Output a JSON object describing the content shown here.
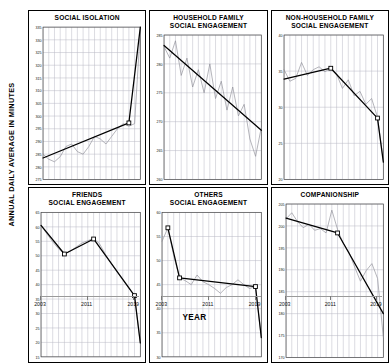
{
  "chart_data": {
    "type": "line",
    "title": "",
    "xlabel": "YEAR",
    "ylabel": "ANNUAL DAILY AVERAGE IN MINUTES",
    "grid": true,
    "legend": false,
    "xticks": [
      "2003",
      "2011",
      "2019"
    ],
    "panels": [
      {
        "id": "social-isolation",
        "title": "SOCIAL ISOLATION",
        "ylim": [
          275,
          335
        ],
        "yticks": [
          335,
          330,
          325,
          320,
          315,
          310,
          305,
          300,
          295,
          290,
          285,
          280,
          275
        ],
        "x": [
          2003,
          2004,
          2005,
          2006,
          2007,
          2008,
          2009,
          2010,
          2011,
          2012,
          2013,
          2014,
          2015,
          2016,
          2017,
          2018,
          2019,
          2020
        ],
        "series": [
          {
            "name": "observed",
            "style": "thin-gray",
            "values": [
              285,
              283,
              282,
              284,
              288,
              289,
              286,
              285,
              288,
              292,
              291,
              289,
              292,
              295,
              297,
              296,
              297,
              334
            ]
          },
          {
            "name": "trend",
            "style": "thick-black",
            "breakpoints": [
              [
                2003,
                283.5
              ],
              [
                2018,
                297.3
              ],
              [
                2020,
                335.0
              ]
            ],
            "markers": [
              [
                2018,
                297.3
              ]
            ]
          }
        ]
      },
      {
        "id": "household-family-social-engagement",
        "title": "HOUSEHOLD FAMILY\nSOCIAL ENGAGEMENT",
        "ylim": [
          260,
          285
        ],
        "yticks": [
          285,
          280,
          275,
          270,
          265,
          260
        ],
        "x": [
          2003,
          2004,
          2005,
          2006,
          2007,
          2008,
          2009,
          2010,
          2011,
          2012,
          2013,
          2014,
          2015,
          2016,
          2017,
          2018,
          2019,
          2020
        ],
        "series": [
          {
            "name": "observed",
            "style": "thin-gray",
            "values": [
              283,
              281,
              284,
              278,
              281,
              276,
              279,
              275,
              280,
              274,
              277,
              272,
              276,
              271,
              273,
              267,
              264,
              269
            ]
          },
          {
            "name": "trend",
            "style": "thick-black",
            "breakpoints": [
              [
                2003,
                283.2
              ],
              [
                2020,
                268.5
              ]
            ],
            "markers": []
          }
        ]
      },
      {
        "id": "non-household-family-social-engagement",
        "title": "NON-HOUSEHOLD FAMILY\nSOCIAL ENGAGEMENT",
        "ylim": [
          20,
          40
        ],
        "yticks": [
          40,
          35,
          30,
          25,
          20
        ],
        "x": [
          2003,
          2004,
          2005,
          2006,
          2007,
          2008,
          2009,
          2010,
          2011,
          2012,
          2013,
          2014,
          2015,
          2016,
          2017,
          2018,
          2019,
          2020
        ],
        "series": [
          {
            "name": "observed",
            "style": "thin-gray",
            "values": [
              35.2,
              33.6,
              34.0,
              36.2,
              34.4,
              35.2,
              35.6,
              34.9,
              35.4,
              34.6,
              32.6,
              33.8,
              31.6,
              32.2,
              30.4,
              31.2,
              28.6,
              22.6
            ]
          },
          {
            "name": "trend",
            "style": "thick-black",
            "breakpoints": [
              [
                2003,
                33.9
              ],
              [
                2011,
                35.4
              ],
              [
                2019,
                28.5
              ],
              [
                2020,
                22.4
              ]
            ],
            "markers": [
              [
                2011,
                35.4
              ],
              [
                2019,
                28.5
              ]
            ]
          }
        ]
      },
      {
        "id": "friends-social-engagement",
        "title": "FRIENDS\nSOCIAL ENGAGEMENT",
        "ylim": [
          15,
          65
        ],
        "yticks": [
          65,
          60,
          55,
          50,
          45,
          40,
          35,
          30,
          25,
          20,
          15
        ],
        "x": [
          2003,
          2004,
          2005,
          2006,
          2007,
          2008,
          2009,
          2010,
          2011,
          2012,
          2013,
          2014,
          2015,
          2016,
          2017,
          2018,
          2019,
          2020
        ],
        "series": [
          {
            "name": "observed",
            "style": "thin-gray",
            "values": [
              60.5,
              57.6,
              54.8,
              52.4,
              50.6,
              51.6,
              53.0,
              54.4,
              55.2,
              56.0,
              54.2,
              50.6,
              47.4,
              44.4,
              41.6,
              38.8,
              36.2,
              19.8
            ]
          },
          {
            "name": "trend",
            "style": "thick-black",
            "breakpoints": [
              [
                2003,
                60.5
              ],
              [
                2007,
                50.6
              ],
              [
                2012,
                55.8
              ],
              [
                2019,
                36.2
              ],
              [
                2020,
                19.8
              ]
            ],
            "markers": [
              [
                2007,
                50.6
              ],
              [
                2012,
                55.8
              ],
              [
                2019,
                36.2
              ]
            ]
          }
        ]
      },
      {
        "id": "others-social-engagement",
        "title": "OTHERS\nSOCIAL ENGAGEMENT",
        "ylim": [
          30,
          60
        ],
        "yticks": [
          60,
          55,
          50,
          45,
          40,
          35,
          30
        ],
        "x": [
          2003,
          2004,
          2005,
          2006,
          2007,
          2008,
          2009,
          2010,
          2011,
          2012,
          2013,
          2014,
          2015,
          2016,
          2017,
          2018,
          2019,
          2020
        ],
        "series": [
          {
            "name": "observed",
            "style": "thin-gray",
            "values": [
              54.0,
              56.8,
              51.0,
              46.4,
              45.8,
              45.0,
              47.0,
              45.6,
              45.0,
              44.2,
              43.2,
              44.4,
              45.0,
              46.0,
              45.0,
              44.2,
              44.6,
              34.0
            ]
          },
          {
            "name": "trend",
            "style": "thick-black",
            "breakpoints": [
              [
                2004,
                56.8
              ],
              [
                2006,
                46.4
              ],
              [
                2019,
                44.6
              ],
              [
                2020,
                34.0
              ]
            ],
            "markers": [
              [
                2004,
                56.8
              ],
              [
                2006,
                46.4
              ],
              [
                2019,
                44.6
              ]
            ]
          }
        ]
      },
      {
        "id": "companionship",
        "title": "COMPANIONSHIP",
        "ylim": [
          170,
          205
        ],
        "yticks": [
          205,
          200,
          195,
          190,
          185,
          180,
          175,
          170
        ],
        "x": [
          2003,
          2004,
          2005,
          2006,
          2007,
          2008,
          2009,
          2010,
          2011,
          2012,
          2013,
          2014,
          2015,
          2016,
          2017,
          2018,
          2019,
          2020
        ],
        "series": [
          {
            "name": "observed",
            "style": "thin-gray",
            "values": [
              201.6,
              203.0,
              201.0,
              199.6,
              200.4,
              199.0,
              199.4,
              198.4,
              203.6,
              199.2,
              196.0,
              194.0,
              190.6,
              187.4,
              189.8,
              191.4,
              188.0,
              174.6
            ]
          },
          {
            "name": "trend",
            "style": "thick-black",
            "breakpoints": [
              [
                2003,
                201.8
              ],
              [
                2012,
                198.4
              ],
              [
                2020,
                180.0
              ]
            ],
            "markers": [
              [
                2012,
                198.4
              ]
            ]
          }
        ]
      }
    ]
  }
}
